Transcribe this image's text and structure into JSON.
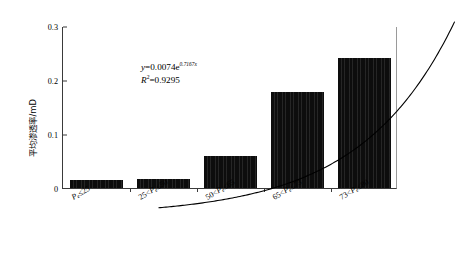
{
  "chart_data": {
    "type": "bar",
    "title": "",
    "xlabel": "",
    "ylabel": "平均渗透率/mD",
    "categories": [
      "P_e≤25",
      "25<P_e≤50",
      "50<P_e≤65",
      "65<P_e≤73",
      "73<P_e≤80"
    ],
    "category_parts": [
      {
        "lead": "",
        "op1": "",
        "sym": "P",
        "sub": "e",
        "op2": "≤",
        "hi": "25"
      },
      {
        "lead": "25",
        "op1": "<",
        "sym": "P",
        "sub": "e",
        "op2": "≤",
        "hi": "50"
      },
      {
        "lead": "50",
        "op1": "<",
        "sym": "P",
        "sub": "e",
        "op2": "≤",
        "hi": "65"
      },
      {
        "lead": "65",
        "op1": "<",
        "sym": "P",
        "sub": "e",
        "op2": "≤",
        "hi": "73"
      },
      {
        "lead": "73",
        "op1": "<",
        "sym": "P",
        "sub": "e",
        "op2": "≤",
        "hi": "80"
      }
    ],
    "values": [
      0.015,
      0.017,
      0.06,
      0.178,
      0.24
    ],
    "ylim": [
      0,
      0.3
    ],
    "yticks": [
      0,
      0.1,
      0.2,
      0.3
    ],
    "ytick_labels": [
      "0",
      "0.1",
      "0.2",
      "0.3"
    ],
    "grid": false,
    "legend": "none",
    "series": [
      {
        "name": "平均渗透率",
        "values": [
          0.015,
          0.017,
          0.06,
          0.178,
          0.24
        ]
      }
    ],
    "trendline": {
      "type": "exponential",
      "coefficient": 0.0074,
      "exponent_rate": 0.7167,
      "r_squared": 0.9295,
      "equation_text": "y = 0.0074e0.7167x",
      "r2_text": "R2 = 0.9295",
      "fitted_values": [
        0.0152,
        0.0311,
        0.0637,
        0.1305,
        0.2674
      ]
    },
    "colors": {
      "bar": "#0d0d0d",
      "axis": "#3a3a3a",
      "curve": "#000000",
      "background": "#ffffff"
    }
  },
  "annotation": {
    "equation": {
      "y_sym": "y",
      "eq": "=",
      "coef": "0.0074e",
      "exponent": "0.7167x"
    },
    "r2": {
      "r_sym": "R",
      "sup": "2",
      "eq": "=",
      "value": "0.9295"
    }
  },
  "axes": {
    "y_title": "平均渗透率/mD",
    "y_tick_labels": [
      "0.3",
      "0.2",
      "0.1",
      "0"
    ]
  }
}
